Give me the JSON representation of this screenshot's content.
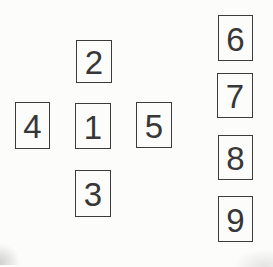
{
  "figure": {
    "cross": {
      "top": "2",
      "left": "4",
      "center": "1",
      "right": "5",
      "bottom": "3"
    },
    "column": [
      "6",
      "7",
      "8",
      "9"
    ]
  },
  "colors": {
    "background": "#fcfcfb",
    "box_border": "#3b3b3b",
    "digit_text": "#373737"
  }
}
